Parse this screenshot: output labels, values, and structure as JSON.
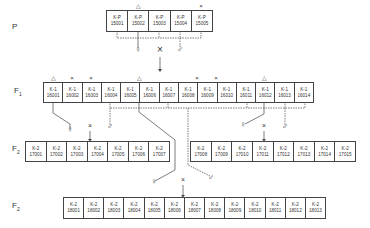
{
  "generations": {
    "P": {
      "label": "P",
      "sub": ""
    },
    "F1": {
      "label": "F",
      "sub": "1"
    },
    "F2a": {
      "label": "F",
      "sub": "2"
    },
    "F2b": {
      "label": "F",
      "sub": "2"
    }
  },
  "rows": {
    "P": [
      {
        "line1": "K-P",
        "line2": "15001"
      },
      {
        "line1": "K-P",
        "line2": "15002"
      },
      {
        "line1": "K-P",
        "line2": "15003"
      },
      {
        "line1": "K-P",
        "line2": "15004"
      },
      {
        "line1": "K-P",
        "line2": "15005"
      }
    ],
    "F1": [
      {
        "line1": "K-1",
        "line2": "16001"
      },
      {
        "line1": "K-1",
        "line2": "16002"
      },
      {
        "line1": "K-1",
        "line2": "16003"
      },
      {
        "line1": "K-1",
        "line2": "16004"
      },
      {
        "line1": "K-1",
        "line2": "16005"
      },
      {
        "line1": "K-1",
        "line2": "16006"
      },
      {
        "line1": "K-1",
        "line2": "16007"
      },
      {
        "line1": "K-1",
        "line2": "16008"
      },
      {
        "line1": "K-1",
        "line2": "16009"
      },
      {
        "line1": "K-1",
        "line2": "16010"
      },
      {
        "line1": "K-1",
        "line2": "16011"
      },
      {
        "line1": "K-1",
        "line2": "16012"
      },
      {
        "line1": "K-1",
        "line2": "16013"
      },
      {
        "line1": "K-1",
        "line2": "16014"
      }
    ],
    "F2_left": [
      {
        "line1": "K-2",
        "line2": "17001"
      },
      {
        "line1": "K-2",
        "line2": "17002"
      },
      {
        "line1": "K-2",
        "line2": "17003"
      },
      {
        "line1": "K-2",
        "line2": "17004"
      },
      {
        "line1": "K-2",
        "line2": "17005"
      },
      {
        "line1": "K-2",
        "line2": "17006"
      },
      {
        "line1": "K-2",
        "line2": "17007"
      }
    ],
    "F2_right": [
      {
        "line1": "K-2",
        "line2": "17008"
      },
      {
        "line1": "K-2",
        "line2": "17009"
      },
      {
        "line1": "K-2",
        "line2": "17010"
      },
      {
        "line1": "K-2",
        "line2": "17011"
      },
      {
        "line1": "K-2",
        "line2": "17012"
      },
      {
        "line1": "K-2",
        "line2": "17013"
      },
      {
        "line1": "K-2",
        "line2": "17014"
      },
      {
        "line1": "K-2",
        "line2": "17015"
      }
    ],
    "F2_bottom": [
      {
        "line1": "K-2",
        "line2": "18001"
      },
      {
        "line1": "K-2",
        "line2": "18002"
      },
      {
        "line1": "K-2",
        "line2": "18003"
      },
      {
        "line1": "K-2",
        "line2": "18004"
      },
      {
        "line1": "K-2",
        "line2": "18005"
      },
      {
        "line1": "K-2",
        "line2": "18006"
      },
      {
        "line1": "K-2",
        "line2": "18007"
      },
      {
        "line1": "K-2",
        "line2": "18008"
      },
      {
        "line1": "K-2",
        "line2": "18009"
      },
      {
        "line1": "K-2",
        "line2": "18010"
      },
      {
        "line1": "K-2",
        "line2": "18011"
      },
      {
        "line1": "K-2",
        "line2": "18012"
      },
      {
        "line1": "K-2",
        "line2": "18013"
      }
    ]
  },
  "markers": {
    "triangle": "△",
    "cross": "×",
    "female": "♀",
    "male": "♂",
    "cross_symbol": "×"
  },
  "colors": {
    "line": "#444444",
    "text": "#333333",
    "background": "#ffffff"
  }
}
